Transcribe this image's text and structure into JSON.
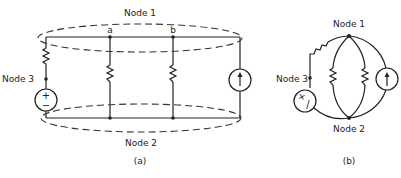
{
  "figure_a": {
    "caption": "(a)",
    "node1_label": "Node 1",
    "node2_label": "Node 2",
    "node3_label": "Node 3",
    "node_a_label": "a",
    "node_b_label": "b",
    "voltage_source": {
      "plus": "+",
      "minus": "−"
    }
  },
  "figure_b": {
    "caption": "(b)",
    "node1_label": "Node 1",
    "node2_label": "Node 2",
    "node3_label": "Node 3",
    "voltage_source": {
      "plus": "+",
      "minus": "/"
    }
  },
  "colors": {
    "line": "#222222",
    "background": "#ffffff"
  }
}
